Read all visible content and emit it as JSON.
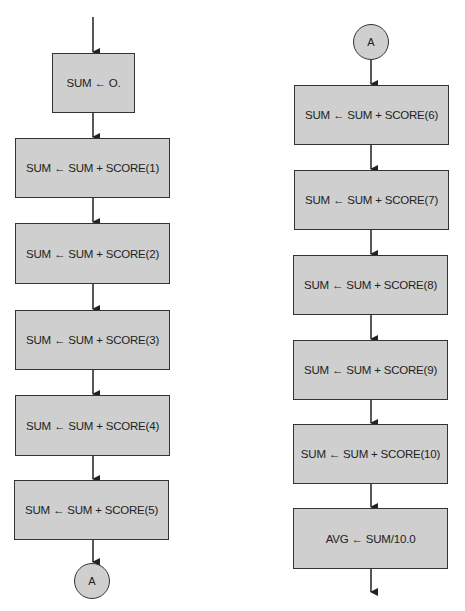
{
  "flowchart": {
    "left_column": {
      "boxes": [
        {
          "label": "SUM ← O."
        },
        {
          "label": "SUM ← SUM + SCORE(1)"
        },
        {
          "label": "SUM ← SUM + SCORE(2)"
        },
        {
          "label": "SUM ← SUM + SCORE(3)"
        },
        {
          "label": "SUM ← SUM + SCORE(4)"
        },
        {
          "label": "SUM ← SUM + SCORE(5)"
        }
      ],
      "connector_out": "A"
    },
    "right_column": {
      "connector_in": "A",
      "boxes": [
        {
          "label": "SUM ← SUM + SCORE(6)"
        },
        {
          "label": "SUM ← SUM + SCORE(7)"
        },
        {
          "label": "SUM ← SUM + SCORE(8)"
        },
        {
          "label": "SUM ← SUM + SCORE(9)"
        },
        {
          "label": "SUM ← SUM + SCORE(10)"
        },
        {
          "label": "AVG ← SUM/10.0"
        }
      ]
    },
    "colors": {
      "fill": "#cfcfcf",
      "stroke": "#333333",
      "background": "#ffffff"
    }
  }
}
